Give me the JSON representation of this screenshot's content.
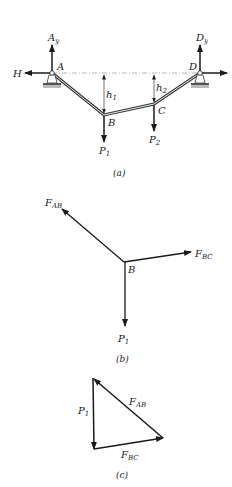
{
  "figure_a": {
    "caption": "(a)",
    "nodes": {
      "A": "A",
      "B": "B",
      "C": "C",
      "D": "D"
    },
    "reactions": {
      "Ay": "A",
      "Ay_sub": "y",
      "Dy": "D",
      "Dy_sub": "y",
      "H": "H"
    },
    "loads": {
      "P1": "P",
      "P1_sub": "1",
      "P2": "P",
      "P2_sub": "2"
    },
    "heights": {
      "h1": "h",
      "h1_sub": "1",
      "h2": "h",
      "h2_sub": "2"
    }
  },
  "figure_b": {
    "caption": "(b)",
    "node": "B",
    "forces": {
      "FAB": "F",
      "FAB_sub": "AB",
      "FBC": "F",
      "FBC_sub": "BC",
      "P1": "P",
      "P1_sub": "1"
    }
  },
  "figure_c": {
    "caption": "(c)",
    "forces": {
      "P1": "P",
      "P1_sub": "1",
      "FAB": "F",
      "FAB_sub": "AB",
      "FBC": "F",
      "FBC_sub": "BC"
    }
  },
  "colors": {
    "ink": "#1a1a1a",
    "cable": "#555555",
    "dash": "#9a9a9a",
    "ground": "#8a8a8a"
  }
}
